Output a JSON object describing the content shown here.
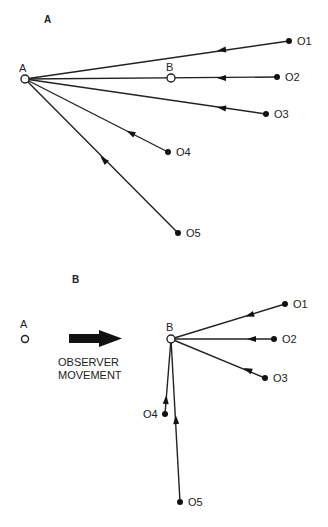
{
  "panels": [
    {
      "label": "A",
      "observer": {
        "label": "A",
        "x": 25,
        "y": 79
      },
      "secondary_marker": {
        "label": "B",
        "x": 171,
        "y": 78
      },
      "objects": [
        {
          "label": "O1",
          "x": 289,
          "y": 41,
          "arrow_x": 222,
          "arrow_y": 50
        },
        {
          "label": "O2",
          "x": 277,
          "y": 77,
          "arrow_x": 222,
          "arrow_y": 78
        },
        {
          "label": "O3",
          "x": 266,
          "y": 114,
          "arrow_x": 222,
          "arrow_y": 108
        },
        {
          "label": "O4",
          "x": 168,
          "y": 152,
          "arrow_x": 131,
          "arrow_y": 133
        },
        {
          "label": "O5",
          "x": 178,
          "y": 233,
          "arrow_x": 104,
          "arrow_y": 160
        }
      ]
    },
    {
      "label": "B",
      "previous_position": {
        "label": "A",
        "x": 25,
        "y": 339
      },
      "movement": {
        "line1": "OBSERVER",
        "line2": "MOVEMENT",
        "x1": 69,
        "x2": 122,
        "y": 338
      },
      "observer": {
        "label": "B",
        "x": 171,
        "y": 339
      },
      "objects": [
        {
          "label": "O1",
          "x": 285,
          "y": 304,
          "arrow_x": 250,
          "arrow_y": 315
        },
        {
          "label": "O2",
          "x": 274,
          "y": 339,
          "arrow_x": 252,
          "arrow_y": 339
        },
        {
          "label": "O3",
          "x": 265,
          "y": 378,
          "arrow_x": 248,
          "arrow_y": 370
        },
        {
          "label": "O4",
          "x": 165,
          "y": 414,
          "arrow_x": 166,
          "arrow_y": 400
        },
        {
          "label": "O5",
          "x": 180,
          "y": 502,
          "arrow_x": 176,
          "arrow_y": 420
        }
      ]
    }
  ]
}
